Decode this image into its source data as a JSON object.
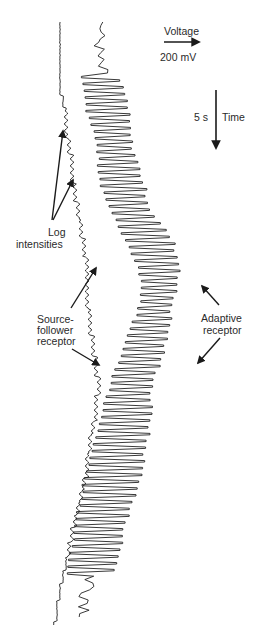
{
  "chart_data": {
    "type": "line",
    "title": "",
    "orientation": "time runs downward, voltage increases to the right",
    "scale_bars": {
      "voltage": {
        "label": "Voltage",
        "value": "200 mV",
        "direction": "right"
      },
      "time": {
        "label": "Time",
        "value": "5 s",
        "direction": "down"
      }
    },
    "annotations": [
      {
        "text": "Log intensities",
        "arrows": 2,
        "target": "steps in source-follower trace"
      },
      {
        "text": "Source-follower receptor",
        "arrows": 2,
        "target": "left staircase trace"
      },
      {
        "text": "Adaptive receptor",
        "arrows": 2,
        "target": "right zigzag trace"
      }
    ],
    "series": [
      {
        "name": "Source-follower receptor",
        "description": "staircase of log-intensity steps with small flicker ripple; drifts right then back left over time",
        "x_px": [
          60,
          61,
          64,
          66,
          70,
          73,
          77,
          82,
          86,
          88,
          92,
          98,
          97,
          90,
          86,
          80,
          73,
          67,
          60,
          55
        ],
        "y_px": [
          22,
          95,
          100,
          130,
          150,
          180,
          205,
          235,
          260,
          305,
          340,
          380,
          410,
          440,
          475,
          500,
          530,
          560,
          590,
          625
        ]
      },
      {
        "name": "Adaptive receptor",
        "description": "square-wave flicker response with transient overshoots, amplitude roughly constant across log-intensity steps",
        "x_left_px": [
          92,
          80,
          84,
          96,
          100,
          110,
          126,
          140,
          142,
          130,
          118,
          108,
          100,
          92,
          84,
          78,
          72,
          66,
          68
        ],
        "x_right_px": [
          110,
          112,
          126,
          130,
          142,
          150,
          172,
          180,
          172,
          168,
          160,
          150,
          150,
          144,
          140,
          128,
          120,
          112,
          100
        ],
        "y_px": [
          22,
          60,
          100,
          140,
          180,
          210,
          240,
          270,
          300,
          330,
          360,
          390,
          420,
          450,
          480,
          510,
          545,
          580,
          620
        ]
      }
    ]
  },
  "labels": {
    "voltage": "Voltage",
    "voltage_scale": "200 mV",
    "time": "Time",
    "time_scale": "5 s",
    "log_intensities_1": "Log",
    "log_intensities_2": "intensities",
    "source_follower_1": "Source-",
    "source_follower_2": "follower",
    "source_follower_3": "receptor",
    "adaptive_1": "Adaptive",
    "adaptive_2": "receptor"
  }
}
